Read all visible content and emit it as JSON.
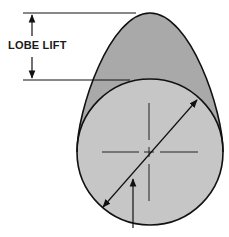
{
  "diagram": {
    "labels": {
      "lobe_lift": "LOBE LIFT"
    },
    "colors": {
      "background": "#ffffff",
      "lobe_fill": "#a9a9a9",
      "base_circle_fill": "#c6c6c6",
      "stroke": "#111111"
    },
    "elements": [
      {
        "name": "lobe-outline",
        "description": "egg-shaped cam lobe"
      },
      {
        "name": "base-circle",
        "description": "base circle of cam"
      },
      {
        "name": "center-crosshair",
        "description": "center mark"
      },
      {
        "name": "diameter-arrow",
        "description": "double-headed arrow across base circle"
      },
      {
        "name": "pointer-arrow",
        "description": "arrow pointing to base circle"
      },
      {
        "name": "lobe-lift-dimension",
        "description": "vertical double arrow between top of lobe and top of base circle"
      }
    ]
  }
}
